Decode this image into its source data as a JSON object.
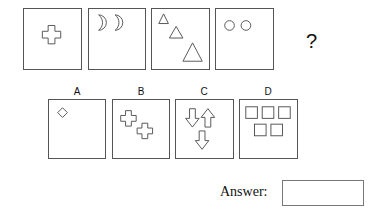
{
  "question": {
    "sequence": [
      {
        "figure": "single-cross",
        "shape": "cross",
        "count": 1
      },
      {
        "figure": "two-crescents",
        "shape": "crescent",
        "count": 2
      },
      {
        "figure": "three-triangles",
        "shape": "triangle",
        "count": 3
      },
      {
        "figure": "two-circles",
        "shape": "circle",
        "count": 2
      }
    ],
    "missing_marker": "?"
  },
  "options": [
    {
      "label": "A",
      "shape": "diamond",
      "count": 1
    },
    {
      "label": "B",
      "shape": "cross",
      "count": 2
    },
    {
      "label": "C",
      "shape": "arrow",
      "count": 3
    },
    {
      "label": "D",
      "shape": "square",
      "count": 5
    }
  ],
  "answer": {
    "label": "Answer:",
    "value": ""
  }
}
